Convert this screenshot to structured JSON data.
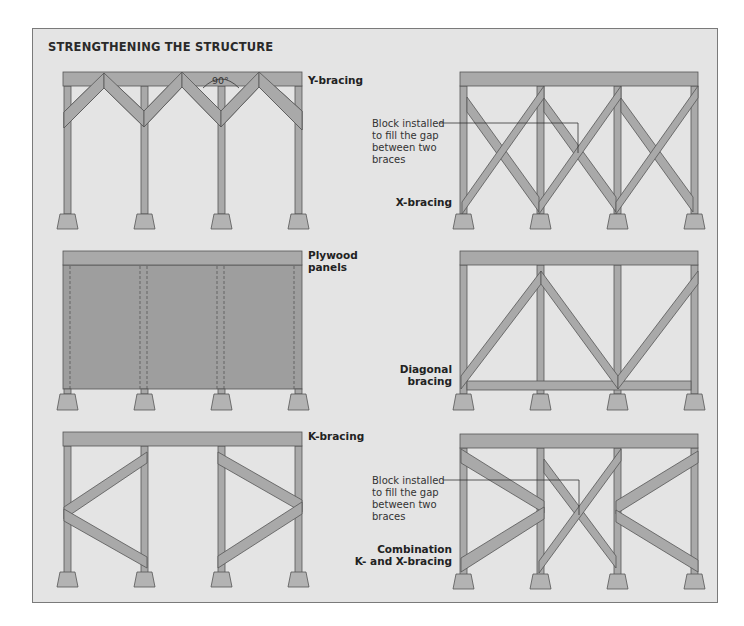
{
  "title": "STRENGTHENING THE STRUCTURE",
  "colors": {
    "background": "#e4e4e4",
    "member": "#a9a9a9",
    "member_outline": "#555555",
    "panel": "#9c9c9c",
    "text": "#222222"
  },
  "diagrams": [
    {
      "id": "y-bracing",
      "label": "Y-bracing",
      "annotation": "90°"
    },
    {
      "id": "x-bracing",
      "label": "X-bracing",
      "note": "Block installed to fill the gap between two braces",
      "note_lines": [
        "Block installed",
        "to fill the gap",
        "between two",
        "braces"
      ]
    },
    {
      "id": "plywood-panels",
      "label_lines": [
        "Plywood",
        "panels"
      ]
    },
    {
      "id": "diagonal-bracing",
      "label_lines": [
        "Diagonal",
        "bracing"
      ]
    },
    {
      "id": "k-bracing",
      "label": "K-bracing"
    },
    {
      "id": "combination",
      "label_lines": [
        "Combination",
        "K- and X-bracing"
      ],
      "note_lines": [
        "Block installed",
        "to fill the gap",
        "between two",
        "braces"
      ]
    }
  ]
}
